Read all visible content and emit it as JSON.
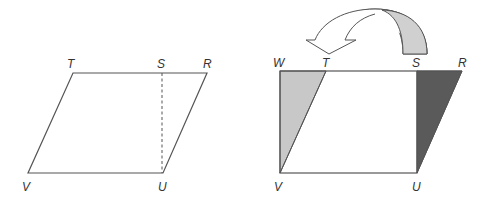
{
  "figures": {
    "left": {
      "title": "parallelogram",
      "labels": {
        "T": "T",
        "S": "S",
        "R": "R",
        "V": "V",
        "U": "U"
      }
    },
    "right": {
      "title": "rectangle",
      "labels": {
        "W": "W",
        "T": "T",
        "S": "S",
        "R": "R",
        "V": "V",
        "U": "U"
      }
    }
  },
  "colors": {
    "stroke": "#555555",
    "light_fill": "#c8c8c8",
    "dark_fill": "#5a5a5a",
    "arrow_fill": "#d0d0d0",
    "label": "#333333"
  }
}
